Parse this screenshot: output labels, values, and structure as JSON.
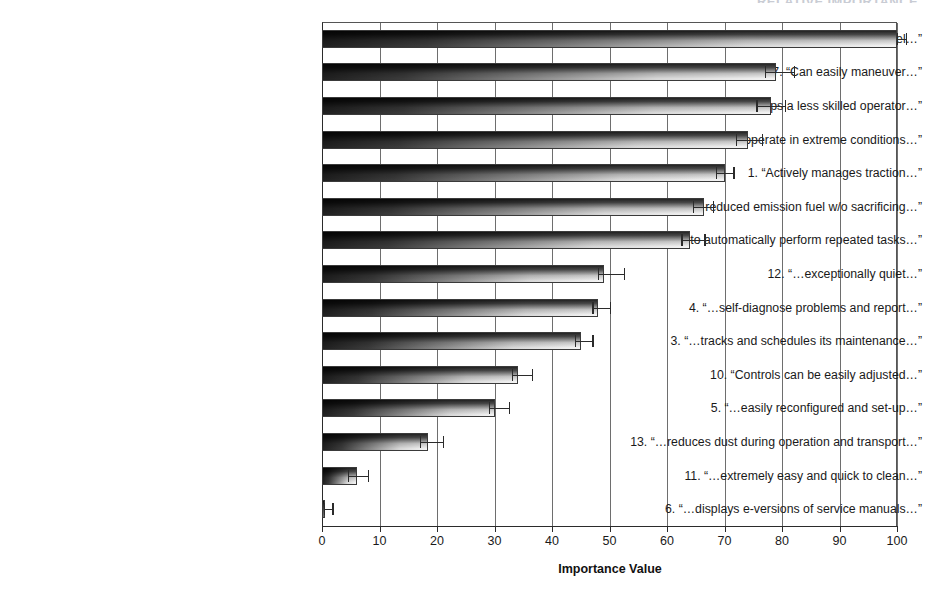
{
  "figure": {
    "cut_off_header": "RELATIVE IMPORTANCE"
  },
  "chart_data": {
    "type": "bar",
    "orientation": "horizontal",
    "title": "",
    "xlabel": "Importance Value",
    "ylabel": "",
    "xlim": [
      0,
      100
    ],
    "xticks": [
      0,
      10,
      20,
      30,
      40,
      50,
      60,
      70,
      80,
      90,
      100
    ],
    "xticklabels": [
      "0",
      "10",
      "20",
      "30",
      "40",
      "50",
      "60",
      "70",
      "80",
      "90",
      "100"
    ],
    "grid": "vertical",
    "legend": "none",
    "error_bars": "95% confidence interval (asymmetric markers shown)",
    "categories": [
      "15. “Uses half as much fuel…”",
      "7. “Can easily maneuver…”",
      "2. “…helps a less skilled operator…”",
      "8. “…operate in extreme conditions…”",
      "1. “Actively manages traction…”",
      "9. “…reduced emission fuel w/o sacrificing…”",
      "14. “…able to automatically perform repeated tasks…”",
      "12. “…exceptionally quiet…”",
      "4. “…self-diagnose problems and report…”",
      "3. “…tracks and schedules its maintenance…”",
      "10. “Controls can be easily adjusted…”",
      "5. “…easily reconfigured and set-up…”",
      "13. “…reduces dust during operation and transport…”",
      "11. “…extremely easy and quick to clean…”",
      "6. “…displays e-versions of service manuals…”"
    ],
    "values": [
      100.0,
      79.0,
      78.0,
      74.0,
      70.0,
      66.5,
      64.0,
      49.0,
      48.0,
      45.0,
      34.0,
      30.0,
      18.5,
      6.0,
      0.5
    ],
    "err_low": [
      100.0,
      77.0,
      75.5,
      72.0,
      68.5,
      64.5,
      62.5,
      48.0,
      47.0,
      44.0,
      33.0,
      29.0,
      17.0,
      4.5,
      0.3
    ],
    "err_high": [
      101.5,
      82.0,
      80.5,
      76.5,
      71.5,
      68.0,
      66.5,
      52.5,
      50.0,
      47.0,
      36.5,
      32.5,
      21.0,
      8.0,
      1.8
    ]
  }
}
